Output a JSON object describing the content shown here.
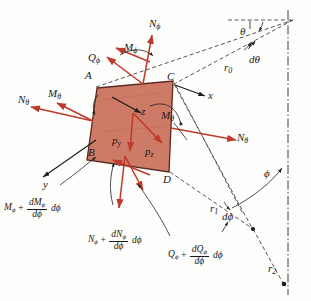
{
  "figure": {
    "type": "engineering-diagram",
    "colors": {
      "element_fill": "#cd7b66",
      "element_edge": "#5a2a1e",
      "force_arrow": "#c0392b",
      "construction_line": "#2b2b2b",
      "background": "#fdfdfc"
    }
  },
  "element": {
    "vertices": [
      {
        "name": "A",
        "label": "A"
      },
      {
        "name": "B",
        "label": "B"
      },
      {
        "name": "C",
        "label": "C"
      },
      {
        "name": "D",
        "label": "D"
      }
    ]
  },
  "axes": [
    {
      "name": "x",
      "label": "x"
    },
    {
      "name": "y",
      "label": "y"
    },
    {
      "name": "z",
      "label": "z"
    }
  ],
  "surface_loads": [
    {
      "name": "p_y",
      "base": "p",
      "sub": "y"
    },
    {
      "name": "p_z",
      "base": "p",
      "sub": "z"
    }
  ],
  "forces": [
    {
      "name": "N-phi-top",
      "base": "N",
      "sub": "ϕ"
    },
    {
      "name": "M-phi-top",
      "base": "M",
      "sub": "ϕ"
    },
    {
      "name": "Q-phi-top",
      "base": "Q",
      "sub": "ϕ"
    },
    {
      "name": "N-theta-left",
      "base": "N",
      "sub": "θ"
    },
    {
      "name": "M-theta-left",
      "base": "M",
      "sub": "θ"
    },
    {
      "name": "N-theta-right",
      "base": "N",
      "sub": "θ"
    },
    {
      "name": "M-theta-right",
      "base": "M",
      "sub": "θ"
    }
  ],
  "incremented_forces": [
    {
      "name": "M-phi-incremented",
      "base": "M",
      "sub": "ϕ",
      "plus": "+",
      "numerator_base": "dM",
      "numerator_sub": "ϕ",
      "denominator": "dϕ",
      "differential": "dϕ"
    },
    {
      "name": "N-phi-incremented",
      "base": "N",
      "sub": "ϕ",
      "plus": "+",
      "numerator_base": "dN",
      "numerator_sub": "ϕ",
      "denominator": "dϕ",
      "differential": "dϕ"
    },
    {
      "name": "Q-phi-incremented",
      "base": "Q",
      "sub": "ϕ",
      "plus": "+",
      "numerator_base": "dQ",
      "numerator_sub": "ϕ",
      "denominator": "dϕ",
      "differential": "dϕ"
    }
  ],
  "geometry": [
    {
      "name": "radius-r0",
      "base": "r",
      "sub": "0"
    },
    {
      "name": "radius-r1",
      "base": "r",
      "sub": "1"
    },
    {
      "name": "radius-r2",
      "base": "r",
      "sub": "2"
    },
    {
      "name": "angle-theta",
      "label": "θ"
    },
    {
      "name": "angle-dtheta",
      "label": "dθ"
    },
    {
      "name": "angle-phi",
      "label": "ϕ"
    },
    {
      "name": "angle-dphi-lower",
      "label": "dϕ"
    },
    {
      "name": "angle-dphi-right",
      "label": "dϕ"
    }
  ]
}
